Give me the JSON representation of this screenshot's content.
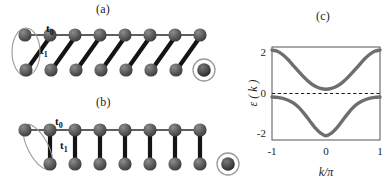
{
  "panels": {
    "a": {
      "label": "(a)",
      "hopping_intracell": "t",
      "hopping_intracell_sub": "0",
      "hopping_intercell": "t",
      "hopping_intercell_sub": "1",
      "top_atom_count": 8,
      "bottom_atom_count": 8,
      "bond_style": "diagonal",
      "left_marker": "vertical-ellipse",
      "right_marker": "circled-atom",
      "description": "Dimerized chain with diagonal t1 bonds; unit cell circled at left, unpaired edge atom circled at bottom right"
    },
    "b": {
      "label": "(b)",
      "hopping_intracell": "t",
      "hopping_intracell_sub": "0",
      "hopping_intercell": "t",
      "hopping_intercell_sub": "1",
      "top_atom_count": 8,
      "bottom_atom_count": 7,
      "bond_style": "vertical",
      "left_marker": "tilted-ellipse",
      "right_marker": "circled-atom",
      "description": "Dimerized chain with vertical t1 bonds; tilted unit cell at left, isolated edge atom circled at bottom right"
    },
    "c": {
      "label": "(c)"
    }
  },
  "colors": {
    "atom_fill": "#5e5e5e",
    "atom_dark": "#3a3a3a",
    "atom_highlight": "#8d8d8d",
    "bond_thin": "#2b2b2b",
    "bond_thick": "#1a1a1a",
    "ellipse_stroke": "#9a9a9a",
    "band_curve": "#6e6e6e",
    "axis": "#555555",
    "zero_line": "#1a1a1a"
  },
  "chart_data": {
    "type": "line",
    "title": "(c)",
    "xlabel": "k/π",
    "ylabel": "ε ( k )",
    "xlim": [
      -1,
      1
    ],
    "ylim": [
      -2.4,
      2.4
    ],
    "xticks": [
      -1,
      0,
      1
    ],
    "xticklabels": [
      "-1",
      "0",
      "1"
    ],
    "yticks": [
      -2,
      0,
      2
    ],
    "yticklabels": [
      "-2",
      "0",
      "2"
    ],
    "grid": false,
    "legend": false,
    "annotations": [
      {
        "type": "hline",
        "y": 0,
        "style": "dashed",
        "label": "Fermi level"
      }
    ],
    "series": [
      {
        "name": "upper band",
        "x": [
          -1.0,
          -0.9,
          -0.8,
          -0.7,
          -0.6,
          -0.5,
          -0.4,
          -0.3,
          -0.2,
          -0.1,
          0.0,
          0.1,
          0.2,
          0.3,
          0.4,
          0.5,
          0.6,
          0.7,
          0.8,
          0.9,
          1.0
        ],
        "values": [
          2.24,
          2.18,
          2.0,
          1.74,
          1.43,
          1.12,
          0.82,
          0.56,
          0.37,
          0.26,
          0.22,
          0.26,
          0.37,
          0.56,
          0.82,
          1.12,
          1.43,
          1.74,
          2.0,
          2.18,
          2.24
        ]
      },
      {
        "name": "lower band",
        "x": [
          -1.0,
          -0.9,
          -0.8,
          -0.7,
          -0.6,
          -0.5,
          -0.4,
          -0.3,
          -0.2,
          -0.1,
          0.0,
          0.1,
          0.2,
          0.3,
          0.4,
          0.5,
          0.6,
          0.7,
          0.8,
          0.9,
          1.0
        ],
        "values": [
          -0.18,
          -0.2,
          -0.25,
          -0.35,
          -0.5,
          -0.73,
          -1.05,
          -1.42,
          -1.78,
          -2.05,
          -2.18,
          -2.05,
          -1.78,
          -1.42,
          -1.05,
          -0.73,
          -0.5,
          -0.35,
          -0.25,
          -0.2,
          -0.18
        ]
      }
    ]
  }
}
